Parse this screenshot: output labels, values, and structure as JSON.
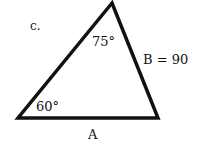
{
  "problem_label": "c.",
  "triangle": {
    "angle_top": "75°",
    "angle_bottom_left": "60°",
    "side_right_label": "B = 90",
    "side_bottom_label": "A",
    "stroke_color": "#111111"
  }
}
